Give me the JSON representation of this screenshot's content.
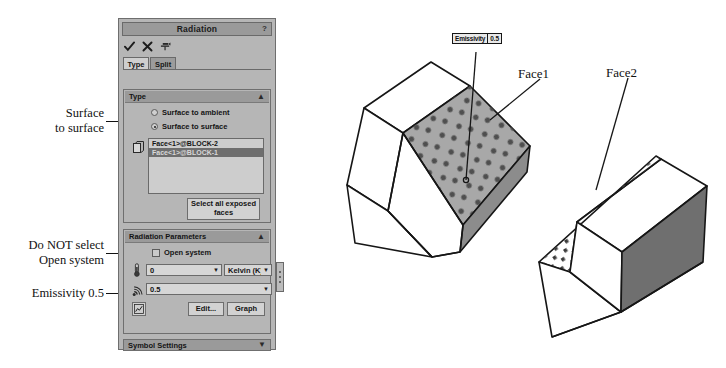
{
  "annotations": [
    {
      "text": "Surface\nto surface",
      "name": "annotation-surface-to-surface"
    },
    {
      "text": "Do NOT select\nOpen system",
      "name": "annotation-do-not-select-open-system"
    },
    {
      "text": "Emissivity 0.5",
      "name": "annotation-emissivity"
    }
  ],
  "panel": {
    "title": "Radiation",
    "help_icon": "?",
    "toolbar": {
      "ok_icon": "check-icon",
      "cancel_icon": "cancel-x-icon",
      "pin_icon": "pin-icon"
    },
    "tabs": [
      {
        "label": "Type",
        "active": true
      },
      {
        "label": "Split",
        "active": false
      }
    ],
    "type_group": {
      "header": "Type",
      "collapse_icon": "chevron-up-icon",
      "options": [
        {
          "label": "Surface to ambient",
          "selected": false
        },
        {
          "label": "Surface to surface",
          "selected": true
        }
      ],
      "selection_icon": "face-select-icon",
      "faces": [
        {
          "label": "Face<1>@BLOCK-2",
          "selected": false
        },
        {
          "label": "Face<1>@BLOCK-1",
          "selected": true
        }
      ],
      "select_all_button": "Select all exposed faces"
    },
    "radiation_parameters": {
      "header": "Radiation Parameters",
      "collapse_icon": "chevron-up-icon",
      "open_system": {
        "label": "Open system",
        "checked": false
      },
      "temperature": {
        "icon": "thermometer-icon",
        "value": "0",
        "unit": "Kelvin (K)",
        "dropdown_icon": "chevron-down-icon"
      },
      "emissivity": {
        "icon": "radiation-icon",
        "value": "0.5",
        "dropdown_icon": "chevron-down-icon"
      },
      "graph_icon": "graph-icon",
      "edit_button": "Edit...",
      "graph_button": "Graph"
    },
    "symbol_settings": {
      "header": "Symbol Settings",
      "expand_icon": "chevron-down-icon"
    },
    "grip_icon": "drag-grip-icon"
  },
  "model": {
    "callout": {
      "key": "Emissivity",
      "value": "0.5"
    },
    "face1_label": "Face1",
    "face2_label": "Face2"
  },
  "colors": {
    "panel_bg": "#b6b6b6",
    "header_bg": "#9a9a9a",
    "selection": "#6e6e6e",
    "field_bg": "#d6d6d6",
    "face_gray": "#a8a8a8",
    "side_dark": "#808080",
    "outline": "#161616"
  }
}
